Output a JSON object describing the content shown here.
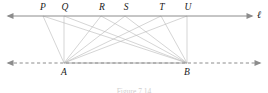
{
  "figure": {
    "caption": "Figure 7.14",
    "line_label": "ℓ",
    "colors": {
      "axis": "#8c8c8c",
      "connector": "#b9b9b9",
      "base_segment": "#a5a5a5",
      "label_text": "#1a1a1a",
      "caption_text": "#cfcfcf",
      "background": "#ffffff"
    },
    "top_line": {
      "name": "line-ell",
      "y": 16,
      "x_start": 8,
      "x_end": 252,
      "style": "solid",
      "arrow_left": true,
      "arrow_right": true
    },
    "bottom_line": {
      "name": "line-ab",
      "y": 63,
      "x_start": 8,
      "x_end": 260,
      "style": "dashed",
      "arrow_left": true,
      "arrow_right": true
    },
    "top_points": [
      {
        "label": "P",
        "x": 43,
        "y": 16,
        "label_x": 43,
        "label_y": 3
      },
      {
        "label": "Q",
        "x": 64,
        "y": 16,
        "label_x": 65,
        "label_y": 3
      },
      {
        "label": "R",
        "x": 101,
        "y": 16,
        "label_x": 102,
        "label_y": 3
      },
      {
        "label": "S",
        "x": 125,
        "y": 16,
        "label_x": 126,
        "label_y": 3
      },
      {
        "label": "T",
        "x": 161,
        "y": 16,
        "label_x": 162,
        "label_y": 3
      },
      {
        "label": "U",
        "x": 187,
        "y": 16,
        "label_x": 188,
        "label_y": 3
      }
    ],
    "bottom_points": [
      {
        "label": "A",
        "x": 64,
        "y": 63,
        "label_x": 64,
        "label_y": 68
      },
      {
        "label": "B",
        "x": 187,
        "y": 63,
        "label_x": 187,
        "label_y": 68
      }
    ],
    "base_segment": {
      "name": "segment-AB",
      "x1": 64,
      "y1": 63,
      "x2": 187,
      "y2": 63
    },
    "connectors": [
      {
        "from": "A",
        "to": "P",
        "x1": 64,
        "y1": 63,
        "x2": 43,
        "y2": 16
      },
      {
        "from": "A",
        "to": "Q",
        "x1": 64,
        "y1": 63,
        "x2": 64,
        "y2": 16
      },
      {
        "from": "A",
        "to": "R",
        "x1": 64,
        "y1": 63,
        "x2": 101,
        "y2": 16
      },
      {
        "from": "A",
        "to": "S",
        "x1": 64,
        "y1": 63,
        "x2": 125,
        "y2": 16
      },
      {
        "from": "A",
        "to": "T",
        "x1": 64,
        "y1": 63,
        "x2": 161,
        "y2": 16
      },
      {
        "from": "A",
        "to": "U",
        "x1": 64,
        "y1": 63,
        "x2": 187,
        "y2": 16
      },
      {
        "from": "B",
        "to": "P",
        "x1": 187,
        "y1": 63,
        "x2": 43,
        "y2": 16
      },
      {
        "from": "B",
        "to": "Q",
        "x1": 187,
        "y1": 63,
        "x2": 64,
        "y2": 16
      },
      {
        "from": "B",
        "to": "R",
        "x1": 187,
        "y1": 63,
        "x2": 101,
        "y2": 16
      },
      {
        "from": "B",
        "to": "S",
        "x1": 187,
        "y1": 63,
        "x2": 125,
        "y2": 16
      },
      {
        "from": "B",
        "to": "T",
        "x1": 187,
        "y1": 63,
        "x2": 161,
        "y2": 16
      },
      {
        "from": "B",
        "to": "U",
        "x1": 187,
        "y1": 63,
        "x2": 187,
        "y2": 16
      }
    ]
  }
}
